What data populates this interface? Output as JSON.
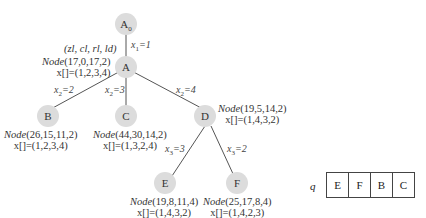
{
  "tree": {
    "root": {
      "label": "A",
      "sub": "0"
    },
    "nodes": {
      "A": {
        "label": "A",
        "node": "(17,0,17,2)",
        "x": "x[]=(1,2,3,4)"
      },
      "B": {
        "label": "B",
        "node": "(26,15,11,2)",
        "x": "x[]=(1,2,3,4)"
      },
      "C": {
        "label": "C",
        "node": "(44,30,14,2)",
        "x": "x[]=(1,3,2,4)"
      },
      "D": {
        "label": "D",
        "node": "(19,5,14,2)",
        "x": "x[]=(1,4,3,2)"
      },
      "E": {
        "label": "E",
        "node": "(19,8,11,4)",
        "x": "x[]=(1,4,3,2)"
      },
      "F": {
        "label": "F",
        "node": "(25,17,8,4)",
        "x": "x[]=(1,4,2,3)"
      }
    },
    "node_word": "Node",
    "legend": "(zl, cl, rl, ld)",
    "edges": {
      "A0_A": {
        "var": "x",
        "sub": "1",
        "val": "=1"
      },
      "A_B": {
        "var": "x",
        "sub": "2",
        "val": "=2"
      },
      "A_C": {
        "var": "x",
        "sub": "2",
        "val": "=3"
      },
      "A_D": {
        "var": "x",
        "sub": "2",
        "val": "=4"
      },
      "D_E": {
        "var": "x",
        "sub": "3",
        "val": "=3"
      },
      "D_F": {
        "var": "x",
        "sub": "3",
        "val": "=2"
      }
    }
  },
  "queue": {
    "label": "q",
    "items": [
      "E",
      "F",
      "B",
      "C"
    ]
  }
}
